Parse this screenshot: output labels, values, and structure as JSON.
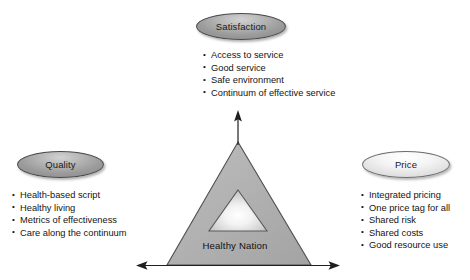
{
  "diagram": {
    "center": {
      "label": "Healthy Nation",
      "triangle_fill": "#b0b0b0",
      "triangle_stroke": "#4f4f4f",
      "inner_triangle_stroke": "#5a5a5a"
    },
    "arrows": {
      "vertical": "up-arrow",
      "horizontal": "double-headed-arrow"
    },
    "nodes": [
      {
        "id": "satisfaction",
        "label": "Satisfaction",
        "style": "dark",
        "fill": "#b4b4b4",
        "stroke": "#4a4a4a",
        "bullets": [
          "Access to service",
          "Good service",
          "Safe environment",
          "Continuum of effective service"
        ]
      },
      {
        "id": "quality",
        "label": "Quality",
        "style": "dark",
        "fill": "#b4b4b4",
        "stroke": "#4a4a4a",
        "bullets": [
          "Health-based script",
          "Healthy living",
          "Metrics of effectiveness",
          "Care along the continuum"
        ]
      },
      {
        "id": "price",
        "label": "Price",
        "style": "light",
        "fill": "#f0f0f0",
        "stroke": "#6d6d6d",
        "bullets": [
          "Integrated pricing",
          "One price tag for all",
          "Shared risk",
          "Shared costs",
          "Good resource use"
        ]
      }
    ]
  }
}
